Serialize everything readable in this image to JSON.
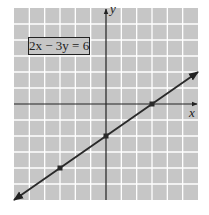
{
  "chart_data": {
    "type": "line",
    "title": "",
    "equation_label": "2x − 3y = 6",
    "xlabel": "x",
    "ylabel": "y",
    "xlim": [
      -6,
      6
    ],
    "ylim": [
      -6,
      6
    ],
    "grid": true,
    "gridlines_every": 1,
    "tick_labels": false,
    "series": [
      {
        "name": "2x − 3y = 6",
        "equation": "y = (2/3)x − 2",
        "line_endpoints": [
          [
            -6,
            -6
          ],
          [
            6,
            2
          ]
        ],
        "arrows_both_ends": true,
        "marked_points": [
          {
            "x": -3,
            "y": -4
          },
          {
            "x": 0,
            "y": -2
          },
          {
            "x": 3,
            "y": 0
          }
        ]
      }
    ]
  },
  "colors": {
    "plot_background": "#c6c6c6",
    "gridline": "#ffffff",
    "axis": "#222222",
    "line": "#2a2a2a"
  }
}
